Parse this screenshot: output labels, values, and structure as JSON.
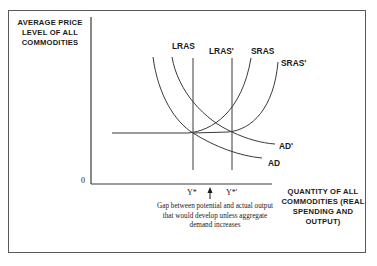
{
  "diagram": {
    "title": "",
    "y_axis_label": "AVERAGE PRICE LEVEL OF ALL COMMODITIES",
    "x_axis_label": "QUANTITY OF ALL COMMODITIES (REAL SPENDING AND OUTPUT)",
    "origin_label": "0",
    "curves": {
      "lras": "LRAS",
      "lras_prime": "LRAS'",
      "sras": "SRAS",
      "sras_prime": "SRAS'",
      "ad": "AD",
      "ad_prime": "AD'"
    },
    "ticks": {
      "y_star": "Y*",
      "y_star_prime": "Y*'"
    },
    "gap_annotation": "Gap between potential and actual output that would develop unless aggregate demand increases",
    "colors": {
      "line": "#3a3a3a",
      "text": "#1a1a1a",
      "border": "#5a5a5a"
    }
  }
}
